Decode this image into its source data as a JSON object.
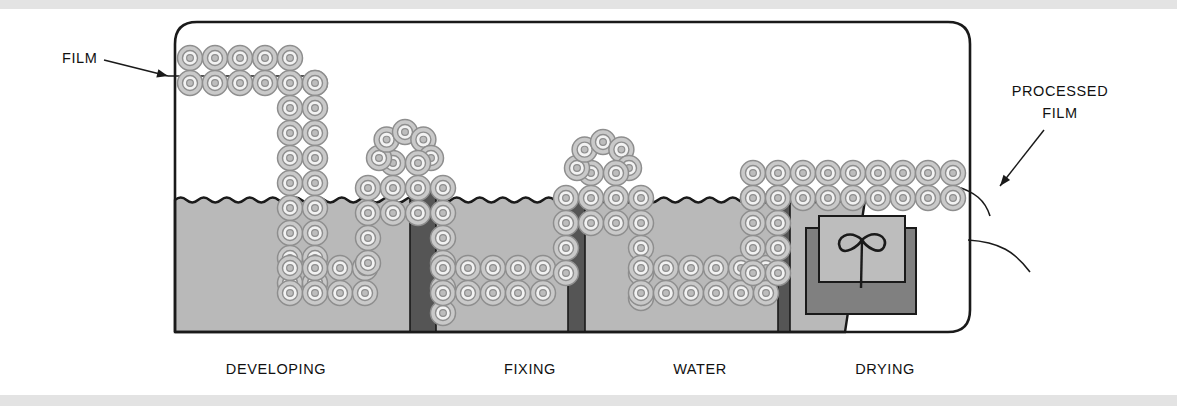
{
  "diagram": {
    "title_visible": false,
    "callouts": [
      {
        "id": "film-in",
        "text": "FILM",
        "x": 62,
        "y": 63,
        "anchor": "start",
        "arrow": {
          "x1": 104,
          "y1": 60,
          "x2": 168,
          "y2": 76
        }
      },
      {
        "id": "processed-film",
        "line1": "PROCESSED",
        "line2": "FILM",
        "x": 1060,
        "y": 96,
        "anchor": "middle",
        "arrow": {
          "x1": 1044,
          "y1": 130,
          "x2": 1000,
          "y2": 186
        }
      }
    ],
    "stages": [
      {
        "id": "developing",
        "label": "DEVELOPING",
        "x": 276,
        "y": 374
      },
      {
        "id": "fixing",
        "label": "FIXING",
        "x": 530,
        "y": 374
      },
      {
        "id": "water",
        "label": "WATER",
        "x": 700,
        "y": 374
      },
      {
        "id": "drying",
        "label": "DRYING",
        "x": 885,
        "y": 374
      }
    ],
    "colors": {
      "outline": "#1a1a1a",
      "liquid": "#b9b9b9",
      "divider": "#555555",
      "roller_ring": "#c9c9c9",
      "roller_stroke": "#8e8e8e",
      "roller_core": "#bdbdbd",
      "dryer_back": "#808080",
      "dryer_front": "#bdbdbd",
      "page": "#ffffff",
      "band": "#e3e3e3"
    },
    "geometry": {
      "housing": {
        "x": 175,
        "y": 22,
        "w": 795,
        "h": 310,
        "corner_radius": 22
      },
      "tank": {
        "x": 175,
        "y": 200,
        "w": 670,
        "h": 132
      },
      "liquid_surface_y": 200,
      "dividers": [
        {
          "id": "divider-1",
          "x": 410,
          "y": 186,
          "w": 26,
          "h": 146
        },
        {
          "id": "divider-2",
          "x": 568,
          "y": 196,
          "w": 17,
          "h": 136
        },
        {
          "id": "divider-3",
          "x": 778,
          "y": 200,
          "w": 12,
          "h": 132
        }
      ],
      "dryer": {
        "back": {
          "x": 806,
          "y": 228,
          "w": 110,
          "h": 86
        },
        "front": {
          "x": 819,
          "y": 216,
          "w": 86,
          "h": 66
        }
      },
      "roller_radius": 12.5
    },
    "roller_paths": [
      {
        "id": "entry-top-row",
        "kind": "row-h",
        "x": 190,
        "y": 58,
        "count": 5,
        "step": 25
      },
      {
        "id": "entry-bottom-row",
        "kind": "row-h",
        "x": 190,
        "y": 83,
        "count": 6,
        "step": 25
      },
      {
        "id": "dev-down-left",
        "kind": "col-v",
        "x": 290,
        "y": 108,
        "count": 8,
        "step": 25
      },
      {
        "id": "dev-down-right",
        "kind": "col-v",
        "x": 315,
        "y": 83,
        "count": 9,
        "step": 25
      },
      {
        "id": "dev-bottom-upper",
        "kind": "row-h",
        "x": 290,
        "y": 268,
        "count": 4,
        "step": 25
      },
      {
        "id": "dev-bottom-lower",
        "kind": "row-h",
        "x": 290,
        "y": 293,
        "count": 4,
        "step": 25
      },
      {
        "id": "arch1-up-outer",
        "kind": "col-v",
        "x": 368,
        "y": 188,
        "count": 4,
        "step": 25
      },
      {
        "id": "arch1-up-inner",
        "kind": "col-v",
        "x": 393,
        "y": 163,
        "count": 3,
        "step": 25
      },
      {
        "id": "arch1-crown",
        "kind": "arch",
        "cx": 405,
        "cy": 150,
        "count": 5
      },
      {
        "id": "arch1-dn-inner",
        "kind": "col-v",
        "x": 418,
        "y": 163,
        "count": 3,
        "step": 25
      },
      {
        "id": "arch1-dn-outer",
        "kind": "col-v",
        "x": 443,
        "y": 188,
        "count": 6,
        "step": 25
      },
      {
        "id": "fix-bottom-upper",
        "kind": "row-h",
        "x": 443,
        "y": 268,
        "count": 5,
        "step": 25
      },
      {
        "id": "fix-bottom-lower",
        "kind": "row-h",
        "x": 443,
        "y": 293,
        "count": 5,
        "step": 25
      },
      {
        "id": "arch2-up-outer",
        "kind": "col-v",
        "x": 566,
        "y": 198,
        "count": 4,
        "step": 25
      },
      {
        "id": "arch2-up-inner",
        "kind": "col-v",
        "x": 591,
        "y": 173,
        "count": 3,
        "step": 25
      },
      {
        "id": "arch2-crown",
        "kind": "arch",
        "cx": 603,
        "cy": 160,
        "count": 5
      },
      {
        "id": "arch2-dn-inner",
        "kind": "col-v",
        "x": 616,
        "y": 173,
        "count": 3,
        "step": 25
      },
      {
        "id": "arch2-dn-outer",
        "kind": "col-v",
        "x": 641,
        "y": 198,
        "count": 5,
        "step": 25
      },
      {
        "id": "wat-bottom-upper",
        "kind": "row-h",
        "x": 641,
        "y": 268,
        "count": 6,
        "step": 25
      },
      {
        "id": "wat-bottom-lower",
        "kind": "row-h",
        "x": 641,
        "y": 293,
        "count": 6,
        "step": 25
      },
      {
        "id": "wat-rise-outer",
        "kind": "col-v",
        "x": 753,
        "y": 198,
        "count": 4,
        "step": 25
      },
      {
        "id": "wat-rise-inner",
        "kind": "col-v",
        "x": 778,
        "y": 198,
        "count": 4,
        "step": 25
      },
      {
        "id": "exit-top-row",
        "kind": "row-h",
        "x": 753,
        "y": 173,
        "count": 9,
        "step": 25
      },
      {
        "id": "exit-bottom-row",
        "kind": "row-h",
        "x": 753,
        "y": 198,
        "count": 9,
        "step": 25
      }
    ],
    "film_lines": [
      {
        "id": "film-entry-line",
        "d": "M 168 76 L 320 76"
      },
      {
        "id": "exit-curve-upper",
        "d": "M 955 186 C 975 192 985 200 990 216"
      },
      {
        "id": "exit-curve-lower",
        "d": "M 968 240 C 1000 242 1015 252 1030 272"
      }
    ]
  }
}
